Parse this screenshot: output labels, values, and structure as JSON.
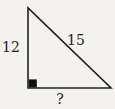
{
  "figure": {
    "type": "right-triangle-diagram",
    "labels": {
      "left_side": "12",
      "hypotenuse": "15",
      "base": "?"
    },
    "colors": {
      "background": "#f3f2ef",
      "stroke": "#222222",
      "right_angle_marker": "#111111"
    }
  }
}
